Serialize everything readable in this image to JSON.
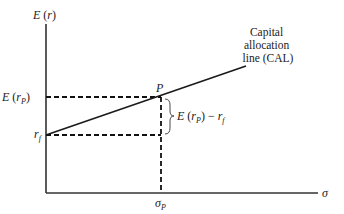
{
  "diagram": {
    "type": "capital-allocation-line",
    "y_axis_label": "E (r)",
    "x_axis_label": "σ",
    "y_ticks": {
      "expected_return_portfolio": "E (r_P)",
      "risk_free": "r_f"
    },
    "x_ticks": {
      "portfolio_sd": "σ_P"
    },
    "point_label": "P",
    "line_label_lines": [
      "Capital",
      "allocation",
      "line (CAL)"
    ],
    "brace_label": "E (r_P) − r_f",
    "colors": {
      "line": "#1a1a1a",
      "axis": "#333333",
      "text": "#222222"
    }
  }
}
